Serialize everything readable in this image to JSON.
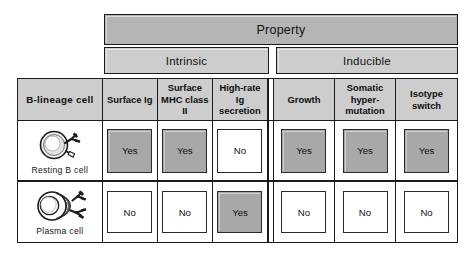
{
  "figure": {
    "title_bar": "Property",
    "groups": [
      {
        "label": "Intrinsic"
      },
      {
        "label": "Inducible"
      }
    ]
  },
  "table": {
    "row_header_label": "B-lineage  cell",
    "columns": [
      {
        "id": "surface-ig",
        "label": "Surface Ig",
        "group": "Intrinsic"
      },
      {
        "id": "surface-mhc-ii",
        "label": "Surface\nMHC class II",
        "group": "Intrinsic"
      },
      {
        "id": "high-rate-ig",
        "label": "High-rate\nIg secretion",
        "group": "Intrinsic"
      },
      {
        "id": "growth",
        "label": "Growth",
        "group": "Inducible"
      },
      {
        "id": "somatic-hypermut",
        "label": "Somatic\nhyper-\nmutation",
        "group": "Inducible"
      },
      {
        "id": "isotype-switch",
        "label": "Isotype\nswitch",
        "group": "Inducible"
      }
    ],
    "rows": [
      {
        "id": "resting-b-cell",
        "label": "Resting B cell",
        "icon": "resting-b-cell-icon",
        "values": [
          "Yes",
          "Yes",
          "No",
          "Yes",
          "Yes",
          "Yes"
        ]
      },
      {
        "id": "plasma-cell",
        "label": "Plasma cell",
        "icon": "plasma-cell-icon",
        "values": [
          "No",
          "No",
          "Yes",
          "No",
          "No",
          "No"
        ]
      }
    ]
  },
  "colors": {
    "property_bar": "#b4b4b4",
    "group_bar": "#cdcdcd",
    "header_cell": "#cdcdcd",
    "yes_chip": "#a8a8a8",
    "no_chip": "#ffffff",
    "border": "#1b1b1b",
    "background": "#ffffff"
  }
}
